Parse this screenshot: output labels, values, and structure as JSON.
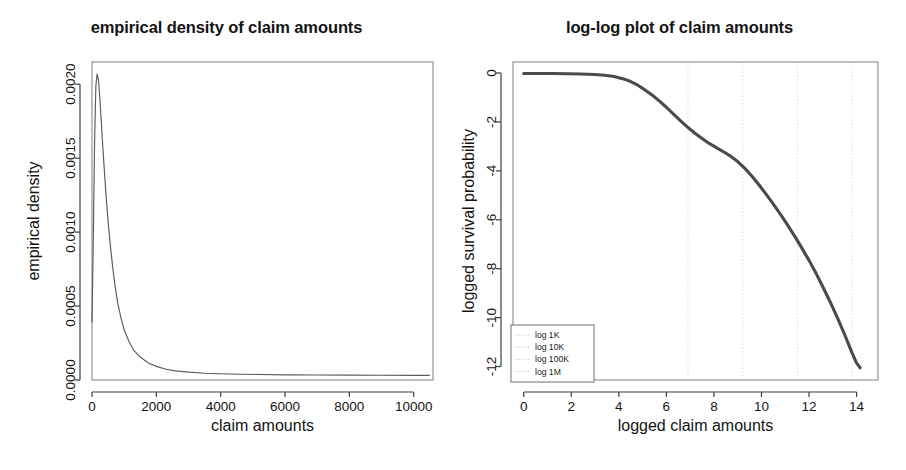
{
  "figure": {
    "background_color": "#ffffff",
    "width": 906,
    "height": 470
  },
  "panels": [
    {
      "id": "empirical-density",
      "title": "empirical density of claim amounts"
    },
    {
      "id": "log-log-plot",
      "title": "log-log plot of claim amounts"
    }
  ],
  "chart_data": [
    {
      "type": "line",
      "id": "empirical-density",
      "title": "empirical density of claim amounts",
      "xlabel": "claim amounts",
      "ylabel": "empirical density",
      "xlim": [
        0,
        10600
      ],
      "ylim": [
        0,
        0.00215
      ],
      "xticks": [
        0,
        2000,
        4000,
        6000,
        8000,
        10000
      ],
      "xtick_labels": [
        "0",
        "2000",
        "4000",
        "6000",
        "8000",
        "10000"
      ],
      "yticks": [
        0.0,
        0.0005,
        0.001,
        0.0015,
        0.002
      ],
      "ytick_labels": [
        "0.0000",
        "0.0005",
        "0.0010",
        "0.0015",
        "0.0020"
      ],
      "grid": false,
      "legend": null,
      "series": [
        {
          "name": "empirical density",
          "color": "#5a5a5a",
          "x": [
            0,
            40,
            80,
            120,
            160,
            200,
            240,
            280,
            320,
            380,
            440,
            500,
            570,
            640,
            720,
            800,
            900,
            1000,
            1150,
            1300,
            1500,
            1750,
            2000,
            2300,
            2600,
            3000,
            3500,
            4000,
            4600,
            5200,
            6000,
            7000,
            8000,
            9000,
            10000,
            10500
          ],
          "y": [
            0.00039,
            0.00095,
            0.0016,
            0.00199,
            0.00207,
            0.00203,
            0.00192,
            0.00178,
            0.00163,
            0.00143,
            0.00124,
            0.00107,
            0.00091,
            0.00077,
            0.00063,
            0.00052,
            0.00042,
            0.00034,
            0.00026,
            0.0002,
            0.000155,
            0.000115,
            9.2e-05,
            7.3e-05,
            6.2e-05,
            5.3e-05,
            4.6e-05,
            4.2e-05,
            3.9e-05,
            3.7e-05,
            3.5e-05,
            3.4e-05,
            3.3e-05,
            3.2e-05,
            3.1e-05,
            3.1e-05
          ]
        }
      ]
    },
    {
      "type": "line",
      "id": "log-log-plot",
      "title": "log-log plot of claim amounts",
      "xlabel": "logged claim amounts",
      "ylabel": "logged survival probability",
      "xlim": [
        -0.45,
        14.9
      ],
      "ylim": [
        -12.55,
        0.45
      ],
      "xticks": [
        0,
        2,
        4,
        6,
        8,
        10,
        12,
        14
      ],
      "xtick_labels": [
        "0",
        "2",
        "4",
        "6",
        "8",
        "10",
        "12",
        "14"
      ],
      "yticks": [
        0,
        -2,
        -4,
        -6,
        -8,
        -10,
        -12
      ],
      "ytick_labels": [
        "0",
        "-2",
        "-4",
        "-6",
        "-8",
        "-10",
        "-12"
      ],
      "grid": true,
      "grid_axis": "x",
      "grid_style": "dotted",
      "legend": {
        "position": "bottom-left",
        "entries": [
          {
            "label": "log 1K",
            "value": 6.908,
            "style": "dotted"
          },
          {
            "label": "log 10K",
            "value": 9.21,
            "style": "dotted"
          },
          {
            "label": "log 100K",
            "value": 11.513,
            "style": "dotted"
          },
          {
            "label": "log 1M",
            "value": 13.816,
            "style": "dotted"
          }
        ]
      },
      "series": [
        {
          "name": "logged survival probability",
          "color": "#4a4a4a",
          "x": [
            0.0,
            0.6,
            1.2,
            1.8,
            2.4,
            3.0,
            3.4,
            3.8,
            4.2,
            4.5,
            4.8,
            5.1,
            5.4,
            5.7,
            6.0,
            6.3,
            6.6,
            6.9,
            7.2,
            7.5,
            7.8,
            8.1,
            8.4,
            8.7,
            9.0,
            9.3,
            9.6,
            9.9,
            10.2,
            10.5,
            10.8,
            11.1,
            11.4,
            11.7,
            12.0,
            12.3,
            12.6,
            12.9,
            13.2,
            13.5,
            13.8,
            14.0,
            14.15
          ],
          "y": [
            -0.02,
            -0.02,
            -0.02,
            -0.03,
            -0.04,
            -0.06,
            -0.09,
            -0.14,
            -0.24,
            -0.35,
            -0.5,
            -0.69,
            -0.9,
            -1.14,
            -1.4,
            -1.68,
            -1.96,
            -2.22,
            -2.46,
            -2.68,
            -2.88,
            -3.05,
            -3.22,
            -3.4,
            -3.62,
            -3.9,
            -4.22,
            -4.58,
            -4.96,
            -5.36,
            -5.78,
            -6.22,
            -6.68,
            -7.16,
            -7.66,
            -8.2,
            -8.78,
            -9.38,
            -10.02,
            -10.7,
            -11.42,
            -11.86,
            -12.05
          ]
        }
      ]
    }
  ]
}
